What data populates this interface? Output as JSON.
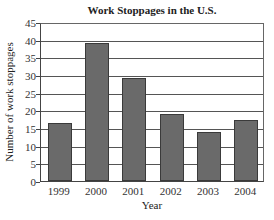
{
  "chart_data": {
    "type": "bar",
    "title": "Work Stoppages in the U.S.",
    "xlabel": "Year",
    "ylabel": "Number of work stoppages",
    "categories": [
      "1999",
      "2000",
      "2001",
      "2002",
      "2003",
      "2004"
    ],
    "values": [
      16.5,
      39.2,
      29.2,
      19.0,
      14.0,
      17.3
    ],
    "ylim": [
      0,
      45
    ],
    "yticks": [
      0,
      5,
      10,
      15,
      20,
      25,
      30,
      35,
      40,
      45
    ],
    "grid": true,
    "legend": null,
    "bar_color": "#6a6a6a"
  },
  "ytick_labels": [
    "0",
    "5",
    "10",
    "15",
    "20",
    "25",
    "30",
    "35",
    "40",
    "45"
  ]
}
